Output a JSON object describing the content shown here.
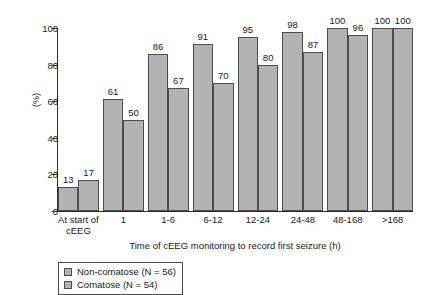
{
  "chart_data": {
    "type": "bar",
    "title": "",
    "xlabel": "Time of cEEG monitoring to record first seizure (h)",
    "ylabel": "(%)",
    "ylim": [
      0,
      100
    ],
    "yticks": [
      0,
      20,
      40,
      60,
      80,
      100
    ],
    "ytick_labels": [
      "0",
      "20",
      "40",
      "60",
      "80",
      "100"
    ],
    "grid": false,
    "legend_position": "bottom-left",
    "categories": [
      "At start of\ncEEG",
      "1",
      "1-6",
      "6-12",
      "12-24",
      "24-48",
      "48-168",
      ">168"
    ],
    "series": [
      {
        "name": "Non-comatose (N = 56)",
        "color": "#b3b3b3",
        "values": [
          13,
          61,
          86,
          91,
          95,
          98,
          100,
          100
        ]
      },
      {
        "name": "Comatose (N = 54)",
        "color": "#b3b3b3",
        "values": [
          17,
          50,
          67,
          70,
          80,
          87,
          96,
          100
        ]
      }
    ],
    "value_labels": [
      [
        "13",
        "61",
        "86",
        "91",
        "95",
        "98",
        "100",
        "100"
      ],
      [
        "17",
        "50",
        "67",
        "70",
        "80",
        "87",
        "96",
        "100"
      ]
    ]
  },
  "legend": {
    "items": [
      {
        "label": "Non-comatose (N = 56)",
        "swatch_color": "#b3b3b3"
      },
      {
        "label": "Comatose (N = 54)",
        "swatch_color": "#b3b3b3"
      }
    ]
  },
  "colors": {
    "bar_fill": "#b3b3b3",
    "bar_stroke": "#4d4d4d",
    "axis": "#2b2b2b",
    "text": "#1a1a1a",
    "background": "#ffffff"
  }
}
